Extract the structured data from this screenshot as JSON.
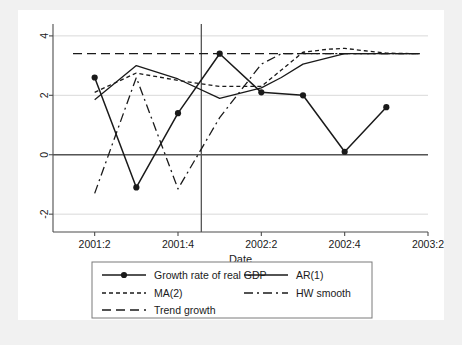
{
  "figure": {
    "background_color": "#f1f1f1",
    "plot_background_color": "#ffffff",
    "line_color": "#1a1a1a",
    "grid_color": "#d9d9d9",
    "axis_color": "#4d4d4d"
  },
  "chart_data": {
    "type": "line",
    "title": "",
    "xlabel": "Date",
    "ylabel": "",
    "xlim": [
      2001.25,
      2003.5
    ],
    "ylim": [
      -2.6,
      4.4
    ],
    "xticks": [
      2001.5,
      2002.0,
      2002.5,
      2003.0,
      2003.5
    ],
    "xticklabels": [
      "2001:2",
      "2001:4",
      "2002:2",
      "2002:4",
      "2003:2"
    ],
    "yticks": [
      -2,
      0,
      2,
      4
    ],
    "yticklabels": [
      "-2",
      "0",
      "2",
      "4"
    ],
    "grid": "horizontal",
    "legend_position": "below",
    "zero_line": 0,
    "vertical_reference_line": {
      "x": 2002.14,
      "label": ""
    },
    "series": [
      {
        "name": "Growth rate of real GDP",
        "style": "solid-marker",
        "marker": "circle",
        "x": [
          2001.5,
          2001.75,
          2002.0,
          2002.25,
          2002.5,
          2002.75,
          2003.0,
          2003.25
        ],
        "y": [
          2.6,
          -1.1,
          1.4,
          3.4,
          2.1,
          2.0,
          0.1,
          1.6
        ]
      },
      {
        "name": "AR(1)",
        "style": "solid",
        "x": [
          2001.5,
          2001.75,
          2002.0,
          2002.25,
          2002.5,
          2002.62,
          2002.75,
          2003.0,
          2003.25,
          2003.45
        ],
        "y": [
          1.85,
          3.0,
          2.55,
          1.9,
          2.25,
          2.6,
          3.05,
          3.4,
          3.4,
          3.4
        ]
      },
      {
        "name": "MA(2)",
        "style": "dashed-short",
        "x": [
          2001.5,
          2001.75,
          2002.0,
          2002.25,
          2002.5,
          2002.62,
          2002.75,
          2002.9,
          2003.0,
          2003.12,
          2003.25,
          2003.45
        ],
        "y": [
          2.1,
          2.75,
          2.5,
          2.3,
          2.3,
          2.85,
          3.45,
          3.55,
          3.58,
          3.5,
          3.42,
          3.4
        ]
      },
      {
        "name": "Trend growth",
        "style": "dashed-long",
        "x": [
          2001.37,
          2003.45
        ],
        "y": [
          3.4,
          3.4
        ]
      },
      {
        "name": "HW smooth",
        "style": "dash-dot",
        "x": [
          2001.5,
          2001.75,
          2002.0,
          2002.25,
          2002.5,
          2002.62,
          2002.75,
          2003.0,
          2003.25,
          2003.45
        ],
        "y": [
          -1.3,
          2.6,
          -1.15,
          1.25,
          3.05,
          3.4,
          3.4,
          3.4,
          3.4,
          3.4
        ]
      }
    ],
    "legend_entries": [
      {
        "label": "Growth rate of real GDP",
        "style": "solid-marker",
        "column": 0,
        "row": 0
      },
      {
        "label": "AR(1)",
        "style": "solid",
        "column": 1,
        "row": 0
      },
      {
        "label": "MA(2)",
        "style": "dashed-short",
        "column": 0,
        "row": 1
      },
      {
        "label": "HW smooth",
        "style": "dash-dot",
        "column": 1,
        "row": 1
      },
      {
        "label": "Trend growth",
        "style": "dashed-long",
        "column": 0,
        "row": 2
      }
    ]
  }
}
